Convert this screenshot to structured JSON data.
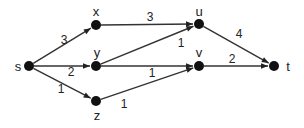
{
  "diagram": {
    "type": "directed-weighted-graph",
    "nodes": [
      {
        "id": "s",
        "label": "s",
        "x": 29,
        "y": 66,
        "lx": 18,
        "ly": 66
      },
      {
        "id": "x",
        "label": "x",
        "x": 96,
        "y": 25,
        "lx": 96,
        "ly": 11
      },
      {
        "id": "y",
        "label": "y",
        "x": 96,
        "y": 66,
        "lx": 97,
        "ly": 52
      },
      {
        "id": "z",
        "label": "z",
        "x": 96,
        "y": 101,
        "lx": 97,
        "ly": 115
      },
      {
        "id": "u",
        "label": "u",
        "x": 199,
        "y": 24,
        "lx": 199,
        "ly": 11
      },
      {
        "id": "v",
        "label": "v",
        "x": 199,
        "y": 66,
        "lx": 199,
        "ly": 52
      },
      {
        "id": "t",
        "label": "t",
        "x": 274,
        "y": 66,
        "lx": 288,
        "ly": 66
      }
    ],
    "edges": [
      {
        "from": "s",
        "to": "x",
        "weight": "3",
        "wx": 64,
        "wy": 40
      },
      {
        "from": "s",
        "to": "y",
        "weight": "2",
        "wx": 71,
        "wy": 72
      },
      {
        "from": "s",
        "to": "z",
        "weight": "1",
        "wx": 61,
        "wy": 89
      },
      {
        "from": "x",
        "to": "u",
        "weight": "3",
        "wx": 150,
        "wy": 17
      },
      {
        "from": "y",
        "to": "u",
        "weight": "1",
        "wx": 181,
        "wy": 43
      },
      {
        "from": "y",
        "to": "v",
        "weight": "1",
        "wx": 152,
        "wy": 73
      },
      {
        "from": "z",
        "to": "v",
        "weight": "1",
        "wx": 124,
        "wy": 104
      },
      {
        "from": "u",
        "to": "t",
        "weight": "4",
        "wx": 239,
        "wy": 34
      },
      {
        "from": "v",
        "to": "t",
        "weight": "2",
        "wx": 232,
        "wy": 59
      }
    ],
    "colors": {
      "node": "#111111",
      "edge": "#333333",
      "text": "#222222"
    }
  }
}
